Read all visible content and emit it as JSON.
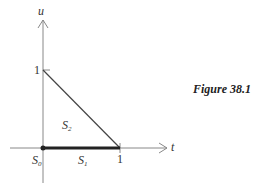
{
  "figure": {
    "caption": "Figure 38.1",
    "axes": {
      "x_label": "t",
      "y_label": "u"
    },
    "ticks": {
      "x_one": "1",
      "y_one": "1"
    },
    "regions": {
      "s0": {
        "base": "S",
        "sub": "0"
      },
      "s1": {
        "base": "S",
        "sub": "1"
      },
      "s2": {
        "base": "S",
        "sub": "2"
      }
    },
    "colors": {
      "axis": "#888888",
      "edge": "#444444",
      "bold_edge": "#222222"
    }
  }
}
